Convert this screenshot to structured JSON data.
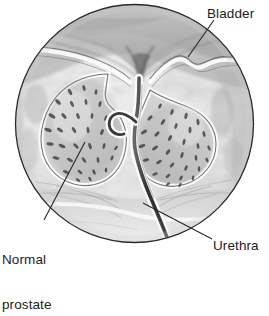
{
  "figure": {
    "medium": "grayscale medical illustration",
    "frame_shape": "circle",
    "background_color": "#ffffff",
    "outline_color": "#2b2b2b",
    "leader_line_color": "#262626"
  },
  "labels": {
    "bladder": "Bladder",
    "urethra": "Urethra",
    "prostate_line1": "Normal",
    "prostate_line2": "prostate"
  },
  "anatomy": {
    "bladder_name": "bladder",
    "prostate_left_lobe_name": "left prostate lobe",
    "prostate_right_lobe_name": "right prostate lobe",
    "urethra_name": "urethra",
    "surrounding_tissue_name": "pelvic soft tissue"
  },
  "colors": {
    "tissue_light": "#f2f2f2",
    "tissue_mid": "#c9c9c9",
    "tissue_dark": "#8a8a8a",
    "gland_fill": "#d4d4d4",
    "gland_speckle": "#4a4a4a",
    "capsule_white": "#fbfbfb",
    "urethra_dark": "#3a3a3a",
    "text": "#1d1d1d"
  }
}
